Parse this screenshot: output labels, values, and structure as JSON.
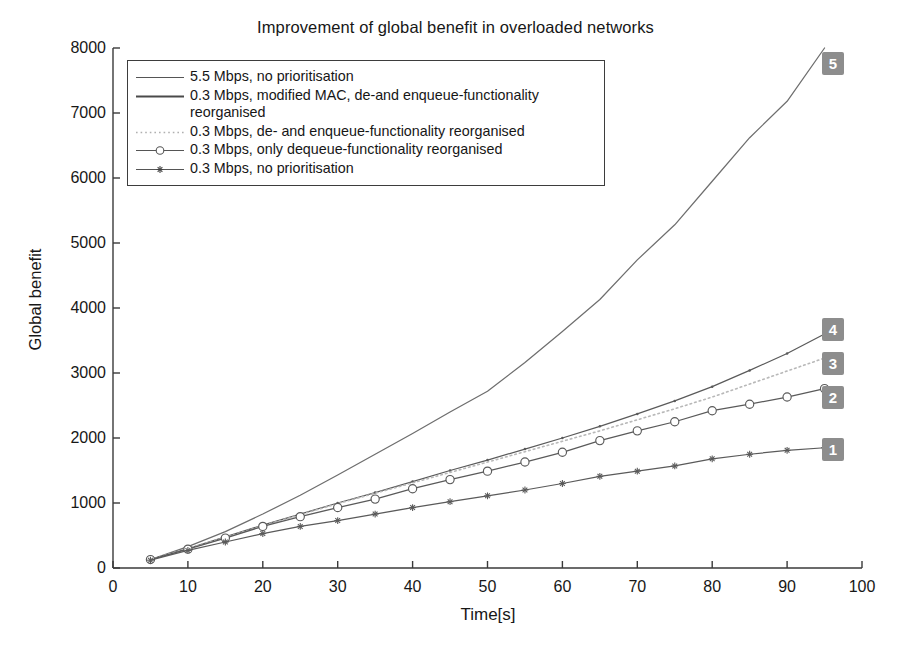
{
  "title": "Improvement of global benefit in overloaded networks",
  "axes": {
    "ylabel": "Global benefit",
    "xlabel": "Time[s]",
    "yticks": [
      "0",
      "1000",
      "2000",
      "3000",
      "4000",
      "5000",
      "6000",
      "7000",
      "8000"
    ],
    "xticks": [
      "0",
      "10",
      "20",
      "30",
      "40",
      "50",
      "60",
      "70",
      "80",
      "90",
      "100"
    ]
  },
  "legend": {
    "entries": [
      {
        "label": "5.5 Mbps, no prioritisation",
        "style": "solid",
        "marker": "none"
      },
      {
        "label": "0.3 Mbps, modified MAC, de-and enqueue-functionality reorganised",
        "style": "solid-thick",
        "marker": "none"
      },
      {
        "label": "0.3 Mbps, de- and enqueue-functionality reorganised",
        "style": "dotted",
        "marker": "none"
      },
      {
        "label": "0.3 Mbps, only dequeue-functionality reorganised",
        "style": "solid",
        "marker": "circle"
      },
      {
        "label": "0.3 Mbps, no prioritisation",
        "style": "solid",
        "marker": "star"
      }
    ]
  },
  "badges": [
    {
      "label": "1",
      "color": "#8d8d8d"
    },
    {
      "label": "2",
      "color": "#8d8d8d"
    },
    {
      "label": "3",
      "color": "#8d8d8d"
    },
    {
      "label": "4",
      "color": "#8d8d8d"
    },
    {
      "label": "5",
      "color": "#8d8d8d"
    }
  ],
  "chart_data": {
    "type": "line",
    "title": "Improvement of global benefit in overloaded networks",
    "xlabel": "Time[s]",
    "ylabel": "Global benefit",
    "xlim": [
      0,
      100
    ],
    "ylim": [
      0,
      8000
    ],
    "xticks": [
      0,
      10,
      20,
      30,
      40,
      50,
      60,
      70,
      80,
      90,
      100
    ],
    "yticks": [
      0,
      1000,
      2000,
      3000,
      4000,
      5000,
      6000,
      7000,
      8000
    ],
    "grid": false,
    "legend_position": "upper-left-inside",
    "x": [
      5,
      10,
      15,
      20,
      25,
      30,
      35,
      40,
      45,
      50,
      55,
      60,
      65,
      70,
      75,
      80,
      85,
      90,
      95
    ],
    "series": [
      {
        "name": "5.5 Mbps, no prioritisation",
        "badge": "5",
        "marker": "none",
        "linestyle": "solid",
        "color": "#6e6e6e",
        "values": [
          130,
          330,
          560,
          830,
          1120,
          1430,
          1750,
          2070,
          2400,
          2720,
          3160,
          3640,
          4130,
          4740,
          5280,
          5950,
          6620,
          7180,
          8000
        ]
      },
      {
        "name": "0.3 Mbps, modified MAC, de-and enqueue-functionality reorganised",
        "badge": "4",
        "marker": "dot",
        "linestyle": "solid",
        "color": "#5a5a5a",
        "values": [
          130,
          300,
          480,
          660,
          830,
          1000,
          1160,
          1330,
          1500,
          1660,
          1830,
          2000,
          2180,
          2370,
          2570,
          2790,
          3040,
          3300,
          3600
        ]
      },
      {
        "name": "0.3 Mbps, de- and enqueue-functionality reorganised",
        "badge": "3",
        "marker": "none",
        "linestyle": "dotted",
        "color": "#b8b8b8",
        "values": [
          130,
          300,
          470,
          650,
          820,
          990,
          1150,
          1310,
          1470,
          1630,
          1790,
          1950,
          2110,
          2280,
          2450,
          2630,
          2830,
          3030,
          3230
        ]
      },
      {
        "name": "0.3 Mbps, only dequeue-functionality reorganised",
        "badge": "2",
        "marker": "circle",
        "linestyle": "solid",
        "color": "#5a5a5a",
        "values": [
          130,
          290,
          460,
          640,
          790,
          930,
          1060,
          1220,
          1360,
          1490,
          1630,
          1780,
          1960,
          2110,
          2250,
          2420,
          2520,
          2630,
          2760
        ]
      },
      {
        "name": "0.3 Mbps, no prioritisation",
        "badge": "1",
        "marker": "star",
        "linestyle": "solid",
        "color": "#5a5a5a",
        "values": [
          120,
          270,
          400,
          530,
          640,
          730,
          830,
          930,
          1020,
          1110,
          1200,
          1300,
          1410,
          1490,
          1570,
          1680,
          1750,
          1810,
          1850
        ]
      }
    ]
  }
}
